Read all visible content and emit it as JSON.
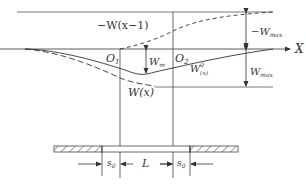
{
  "diagram": {
    "title": "",
    "labels": {
      "neg_w_shifted": "−W(x−1)",
      "axis_x": "X",
      "o1": "O",
      "o1_sub": "1",
      "o2": "O",
      "o2_sub": "2",
      "neg_wmax": "−W",
      "neg_wmax_sub": "max",
      "wmax": "W",
      "wmax_sub": "max",
      "wm": "W",
      "wm_sub": "m",
      "w0x": "W",
      "w0x_sup": "0",
      "w0x_sub": "(x)",
      "wx": "W(x)",
      "s0_left": "s",
      "s0_left_sub": "0",
      "L": "L",
      "s0_right": "s",
      "s0_right_sub": "0"
    },
    "colors": {
      "line": "#333333",
      "hatch": "#444444"
    }
  }
}
